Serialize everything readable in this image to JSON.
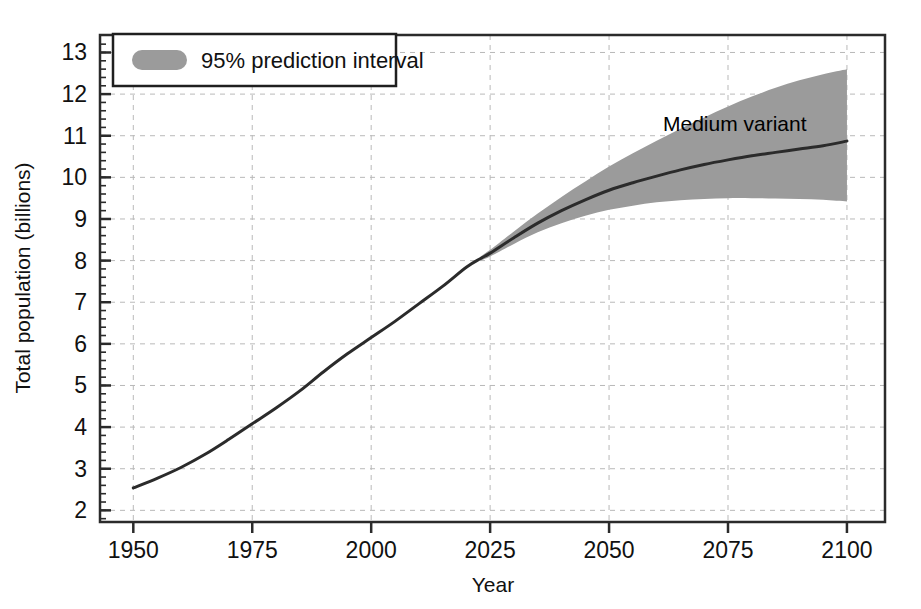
{
  "chart_data": {
    "type": "line",
    "title": "",
    "subtitle": "",
    "xlabel": "Year",
    "ylabel": "Total population (billions)",
    "xlim": [
      1943,
      2108
    ],
    "ylim": [
      1.72,
      13.42
    ],
    "xticks": [
      1950,
      1975,
      2000,
      2025,
      2050,
      2075,
      2100
    ],
    "xtick_labels": [
      "1950",
      "1975",
      "2000",
      "2025",
      "2050",
      "2075",
      "2100"
    ],
    "x_minor_tick_step": 5,
    "yticks": [
      2,
      3,
      4,
      5,
      6,
      7,
      8,
      9,
      10,
      11,
      12,
      13
    ],
    "ytick_labels": [
      "2",
      "3",
      "4",
      "5",
      "6",
      "7",
      "8",
      "9",
      "10",
      "11",
      "12",
      "13"
    ],
    "y_minor_tick_step": 0.2,
    "grid": true,
    "grid_style": "dashed",
    "grid_color": "#b9b9b9",
    "frame": true,
    "frame_color": "#2b2b2b",
    "background": "#ffffff",
    "legend": {
      "position": "top-left",
      "entries": [
        {
          "label": "95% prediction interval",
          "swatch_color": "#9b9b9b",
          "swatch_shape": "rounded-rect"
        }
      ]
    },
    "annotations": [
      {
        "text": "Medium variant",
        "x": 2070,
        "y": 11.55
      }
    ],
    "series": [
      {
        "name": "Medium variant",
        "type": "line",
        "color": "#2b2b2b",
        "line_width": 3,
        "x": [
          1950,
          1955,
          1960,
          1965,
          1970,
          1975,
          1980,
          1985,
          1990,
          1995,
          2000,
          2005,
          2010,
          2015,
          2020,
          2023,
          2025,
          2030,
          2035,
          2040,
          2045,
          2050,
          2055,
          2060,
          2065,
          2070,
          2075,
          2080,
          2085,
          2090,
          2095,
          2100
        ],
        "y": [
          2.54,
          2.77,
          3.03,
          3.34,
          3.7,
          4.08,
          4.46,
          4.87,
          5.33,
          5.76,
          6.15,
          6.54,
          6.96,
          7.38,
          7.84,
          8.05,
          8.18,
          8.55,
          8.9,
          9.2,
          9.46,
          9.69,
          9.87,
          10.03,
          10.18,
          10.31,
          10.42,
          10.52,
          10.6,
          10.68,
          10.76,
          10.87
        ]
      },
      {
        "name": "95% prediction interval",
        "type": "band",
        "color": "#9b9b9b",
        "x": [
          2023,
          2025,
          2030,
          2035,
          2040,
          2045,
          2050,
          2055,
          2060,
          2065,
          2070,
          2075,
          2080,
          2085,
          2090,
          2095,
          2100
        ],
        "y_upper": [
          8.1,
          8.26,
          8.7,
          9.13,
          9.53,
          9.9,
          10.26,
          10.58,
          10.88,
          11.17,
          11.44,
          11.7,
          11.94,
          12.15,
          12.33,
          12.48,
          12.6
        ],
        "y_lower": [
          8.0,
          8.1,
          8.4,
          8.68,
          8.9,
          9.08,
          9.22,
          9.32,
          9.4,
          9.45,
          9.48,
          9.5,
          9.5,
          9.49,
          9.48,
          9.46,
          9.42
        ]
      }
    ],
    "key_readings": {
      "start_year": 1950,
      "start_value": 2.54,
      "end_year": 2100,
      "end_value_median": 10.87,
      "end_value_upper95": 12.6,
      "end_value_lower95": 9.42,
      "projection_start_year": 2023
    }
  }
}
